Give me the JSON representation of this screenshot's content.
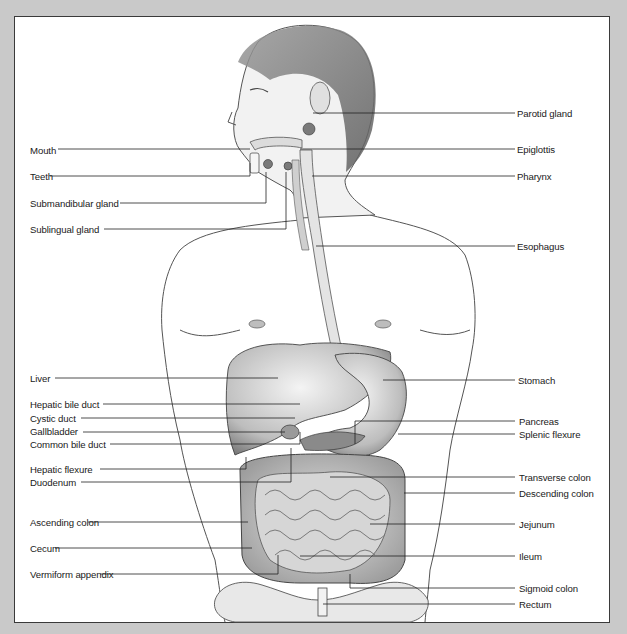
{
  "diagram": {
    "title": "",
    "left_labels": [
      {
        "text": "Mouth",
        "x": 30,
        "y": 145
      },
      {
        "text": "Teeth",
        "x": 30,
        "y": 172
      },
      {
        "text": "Submandibular gland",
        "x": 30,
        "y": 198
      },
      {
        "text": "Sublingual gland",
        "x": 30,
        "y": 225
      },
      {
        "text": "Liver",
        "x": 30,
        "y": 374
      },
      {
        "text": "Hepatic bile duct",
        "x": 30,
        "y": 400
      },
      {
        "text": "Cystic duct",
        "x": 30,
        "y": 414
      },
      {
        "text": "Gallbladder",
        "x": 30,
        "y": 427
      },
      {
        "text": "Common bile duct",
        "x": 30,
        "y": 439
      },
      {
        "text": "Hepatic flexure",
        "x": 30,
        "y": 465
      },
      {
        "text": "Duodenum",
        "x": 30,
        "y": 478
      },
      {
        "text": "Ascending colon",
        "x": 30,
        "y": 518
      },
      {
        "text": "Cecum",
        "x": 30,
        "y": 544
      },
      {
        "text": "Vermiform appendix",
        "x": 30,
        "y": 570
      }
    ],
    "right_labels": [
      {
        "text": "Parotid gland",
        "x": 517,
        "y": 108
      },
      {
        "text": "Epiglottis",
        "x": 517,
        "y": 144
      },
      {
        "text": "Pharynx",
        "x": 517,
        "y": 171
      },
      {
        "text": "Esophagus",
        "x": 517,
        "y": 241
      },
      {
        "text": "Stomach",
        "x": 518,
        "y": 375
      },
      {
        "text": "Pancreas",
        "x": 519,
        "y": 416
      },
      {
        "text": "Splenic flexure",
        "x": 519,
        "y": 429
      },
      {
        "text": "Transverse colon",
        "x": 519,
        "y": 472
      },
      {
        "text": "Descending colon",
        "x": 519,
        "y": 488
      },
      {
        "text": "Jejunum",
        "x": 519,
        "y": 519
      },
      {
        "text": "Ileum",
        "x": 519,
        "y": 551
      },
      {
        "text": "Sigmoid colon",
        "x": 519,
        "y": 583
      },
      {
        "text": "Rectum",
        "x": 519,
        "y": 599
      }
    ]
  }
}
